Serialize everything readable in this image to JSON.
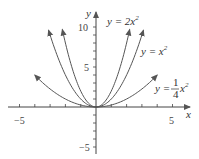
{
  "chart_data": {
    "type": "line",
    "title": "",
    "xlabel": "x",
    "ylabel": "y",
    "xlim": [
      -5.5,
      6
    ],
    "ylim": [
      -6,
      12
    ],
    "x_ticks": [
      -5,
      5
    ],
    "y_ticks": [
      10,
      5,
      -5
    ],
    "grid": false,
    "series": [
      {
        "name": "y = 2x^2",
        "label": "y = 2x²",
        "coef": 2,
        "x_range": [
          -2.2,
          2.2
        ]
      },
      {
        "name": "y = x^2",
        "label": "y = x²",
        "coef": 1,
        "x_range": [
          -3.1,
          3.1
        ]
      },
      {
        "name": "y = (1/4)x^2",
        "label": "y = ¼x²",
        "coef": 0.25,
        "x_range": [
          -4,
          4
        ]
      }
    ]
  },
  "labels": {
    "x_axis": "x",
    "y_axis": "y",
    "tick_neg5_x": "−5",
    "tick_5_x": "5",
    "tick_10_y": "10",
    "tick_5_y": "5",
    "tick_neg5_y": "−5",
    "curve1_prefix": "y = 2x",
    "curve2_prefix": "y = x",
    "curve3_prefix": "y =",
    "exp": "2",
    "frac_num": "1",
    "frac_den": "4",
    "curve3_suffix": "x"
  }
}
